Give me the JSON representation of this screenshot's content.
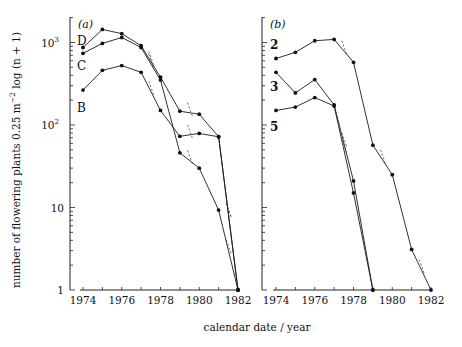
{
  "chart_data": [
    {
      "panel": "(a)",
      "type": "line",
      "title": "",
      "xlabel": "calendar date / year",
      "ylabel": "number of flowering plants 0.25 m^-2 log (n + 1)",
      "yscale": "log",
      "ylim": [
        1,
        2000
      ],
      "xlim": [
        1974,
        1982
      ],
      "x_ticks": [
        "1974",
        "1976",
        "1978",
        "1980",
        "1982"
      ],
      "y_ticks": [
        "1",
        "10",
        "10²",
        "10³"
      ],
      "grid": false,
      "x": [
        1974,
        1975,
        1976,
        1977,
        1978,
        1979,
        1980,
        1981,
        1982
      ],
      "series": [
        {
          "name": "D",
          "values": [
            870,
            1440,
            1280,
            915,
            380,
            147,
            135,
            72,
            1
          ]
        },
        {
          "name": "C",
          "values": [
            740,
            975,
            1150,
            870,
            350,
            46,
            30,
            9.3,
            1
          ]
        },
        {
          "name": "B",
          "values": [
            265,
            460,
            525,
            435,
            150,
            73,
            79,
            72,
            1
          ]
        }
      ]
    },
    {
      "panel": "(b)",
      "type": "line",
      "title": "",
      "xlabel": "calendar date / year",
      "ylabel": "number of flowering plants 0.25 m^-2 log (n + 1)",
      "yscale": "log",
      "ylim": [
        1,
        2000
      ],
      "xlim": [
        1974,
        1982
      ],
      "x_ticks": [
        "1974",
        "1976",
        "1978",
        "1980",
        "1982"
      ],
      "grid": false,
      "x": [
        1974,
        1975,
        1976,
        1977,
        1978,
        1979,
        1980,
        1981,
        1982
      ],
      "series": [
        {
          "name": "2",
          "values": [
            640,
            760,
            1050,
            1090,
            575,
            57,
            25,
            3.1,
            1
          ]
        },
        {
          "name": "3",
          "values": [
            435,
            245,
            355,
            175,
            21,
            1,
            null,
            null,
            null
          ]
        },
        {
          "name": "5",
          "values": [
            150,
            165,
            215,
            170,
            15,
            1,
            null,
            null,
            null
          ]
        }
      ]
    }
  ],
  "labels": {
    "panel_a": "(a)",
    "panel_b": "(b)",
    "xlabel": "calendar date / year",
    "ylabel_main": "number of flowering plants 0.25 m",
    "ylabel_exp": "−2",
    "ylabel_tail": " log (n + 1)",
    "y_ticks": [
      {
        "label": "1",
        "value": 1
      },
      {
        "label": "10",
        "value": 10
      },
      {
        "label": "10",
        "sup": "2",
        "value": 100
      },
      {
        "label": "10",
        "sup": "3",
        "value": 1000
      }
    ],
    "x_ticks": [
      "1974",
      "1976",
      "1978",
      "1980",
      "1982"
    ]
  },
  "series_tags": {
    "a": [
      {
        "name": "D",
        "x": 1974,
        "y": 1050
      },
      {
        "name": "C",
        "x": 1974,
        "y": 520
      },
      {
        "name": "B",
        "x": 1974,
        "y": 160
      }
    ],
    "b": [
      {
        "name": "2",
        "x": 1974,
        "y": 930
      },
      {
        "name": "3",
        "x": 1974,
        "y": 290
      },
      {
        "name": "5",
        "x": 1974,
        "y": 95
      }
    ]
  }
}
